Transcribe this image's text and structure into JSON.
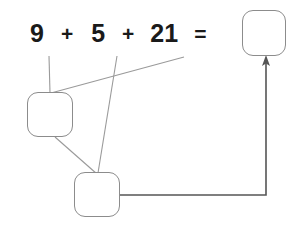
{
  "diagram": {
    "type": "number-bond-decomposition",
    "equation": {
      "terms": [
        "9",
        "5",
        "21"
      ],
      "operators": [
        "+",
        "+"
      ],
      "equals": "=",
      "full_text": "9 + 5 + 21 ="
    },
    "boxes": [
      {
        "id": "answer",
        "label": "",
        "placeholder": "",
        "x": 242,
        "y": 10,
        "w": 44,
        "h": 46
      },
      {
        "id": "partial-left",
        "label": "",
        "placeholder": "",
        "x": 27,
        "y": 92,
        "w": 46,
        "h": 45
      },
      {
        "id": "partial-bottom",
        "label": "",
        "placeholder": "",
        "x": 74,
        "y": 172,
        "w": 46,
        "h": 45
      }
    ],
    "connectors": [
      {
        "from": "term-9",
        "to": "partial-left-box",
        "style": "line"
      },
      {
        "from": "term-21",
        "to": "partial-left-box",
        "style": "line"
      },
      {
        "from": "term-5",
        "to": "partial-bottom-box",
        "style": "line"
      },
      {
        "from": "partial-left-box",
        "to": "partial-bottom-box",
        "style": "line"
      },
      {
        "from": "partial-bottom-box",
        "to": "answer-box",
        "style": "arrow"
      }
    ],
    "colors": {
      "text": "#1a1a1a",
      "box_border": "#8c8c8c",
      "thin_connector": "#9a9a9a",
      "arrow_connector": "#555555",
      "background": "#ffffff"
    }
  }
}
